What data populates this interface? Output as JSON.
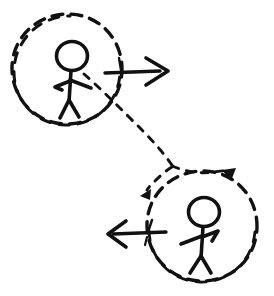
{
  "figure": {
    "background_color": "#ffffff",
    "ink_color": "#111111",
    "width": 274,
    "height": 296,
    "style": "hand-drawn pen sketch"
  },
  "scene": {
    "frames": [
      {
        "id": "frame-a",
        "label": "upper-left dashed circle",
        "center_x": 67,
        "center_y": 69,
        "radius": 55,
        "stroke_style": "dashed"
      },
      {
        "id": "frame-b",
        "label": "lower-right dashed circle",
        "center_x": 202,
        "center_y": 226,
        "radius": 55,
        "stroke_style": "dashed"
      }
    ],
    "people": [
      {
        "id": "person-a",
        "label": "upper-left stick figure",
        "facing": "right",
        "head_x": 72,
        "head_y": 56,
        "head_radius": 15
      },
      {
        "id": "person-b",
        "label": "lower-right stick figure",
        "facing": "right",
        "head_x": 204,
        "head_y": 212,
        "head_radius": 15
      }
    ],
    "arrows": [
      {
        "id": "arrow-right",
        "label": "solid arrow pointing right",
        "direction": "right",
        "tail_x": 105,
        "tail_y": 72,
        "tip_x": 167,
        "tip_y": 72,
        "has_tail_tick": true,
        "stroke_style": "solid"
      },
      {
        "id": "arrow-left",
        "label": "solid arrow pointing left",
        "direction": "left",
        "tail_x": 166,
        "tail_y": 233,
        "tip_x": 108,
        "tip_y": 233,
        "has_tail_tick": true,
        "stroke_style": "solid"
      }
    ],
    "trajectory": {
      "id": "dashed-path",
      "label": "dashed trajectory from upper-left frame to lower-right frame",
      "stroke_style": "dashed",
      "from_x": 86,
      "from_y": 75,
      "to_x": 172,
      "to_y": 166,
      "branch_arrowheads": [
        {
          "id": "arrowhead-down-right",
          "label": "dashed curve arrowhead pointing down-right",
          "x": 228,
          "y": 178,
          "angle_deg": 70
        },
        {
          "id": "arrowhead-down-left",
          "label": "dashed curve arrowhead pointing down-left",
          "x": 146,
          "y": 191,
          "angle_deg": 215
        }
      ]
    }
  }
}
